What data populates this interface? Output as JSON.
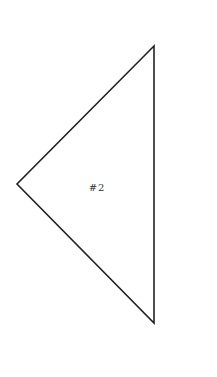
{
  "diagram": {
    "shape": "triangle",
    "label": "#2",
    "stroke_color": "#222222",
    "fill_color": "#ffffff",
    "vertices": [
      [
        154,
        46
      ],
      [
        17,
        184
      ],
      [
        154,
        323
      ]
    ],
    "label_position": [
      97,
      191
    ]
  }
}
